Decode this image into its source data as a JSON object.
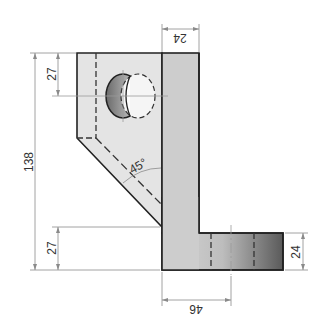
{
  "drawing": {
    "type": "technical-drawing",
    "dimensions": {
      "top_width": "24",
      "hole_offset": "27",
      "total_height": "138",
      "bottom_offset": "27",
      "foot_height": "24",
      "foot_width": "46",
      "angle": "45°"
    },
    "colors": {
      "face_light": "#e2e2e2",
      "face_mid": "#cfcfcf",
      "outline": "#222222",
      "dim_line": "#8a8a8a",
      "gradient_dark": "#555555"
    }
  }
}
